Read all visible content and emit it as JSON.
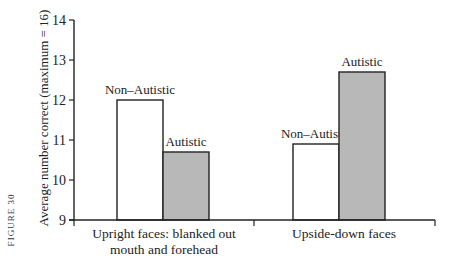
{
  "figure_label": "FIGURE 30",
  "chart_data": {
    "type": "bar",
    "title": "",
    "xlabel": "",
    "ylabel": "Average number correct (maximum = 16)",
    "ylim": [
      9,
      14
    ],
    "yticks": [
      9,
      10,
      11,
      12,
      13,
      14
    ],
    "grid": false,
    "legend": "none (bars labeled directly)",
    "categories": [
      "Upright faces: blanked out mouth and forehead",
      "Upside-down faces"
    ],
    "category_lines": [
      [
        "Upright faces: blanked out",
        "mouth and forehead"
      ],
      [
        "Upside-down faces"
      ]
    ],
    "series": [
      {
        "name": "Non–Autistic",
        "color": "#ffffff",
        "values": [
          12.0,
          10.9
        ]
      },
      {
        "name": "Autistic",
        "color": "#b8b8b8",
        "values": [
          10.7,
          12.7
        ]
      }
    ]
  }
}
